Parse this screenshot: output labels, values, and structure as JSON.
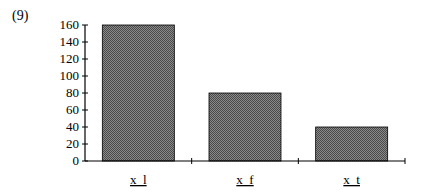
{
  "figure_label": "(9)",
  "chart_data": {
    "type": "bar",
    "title": "",
    "xlabel": "",
    "ylabel": "",
    "categories": [
      "x_l",
      "x_f",
      "x_t"
    ],
    "values": [
      160,
      80,
      40
    ],
    "ylim": [
      0,
      160
    ],
    "yticks": [
      0,
      20,
      40,
      60,
      80,
      100,
      120,
      140,
      160
    ],
    "grid": false,
    "legend": null,
    "bar_fill": "#6e6e6e",
    "bar_pattern": "checkered hatch"
  },
  "category_display": [
    "x  l",
    "x  f",
    "x  t"
  ]
}
